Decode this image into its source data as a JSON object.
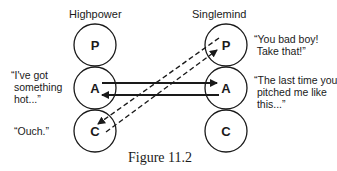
{
  "diagram": {
    "columns": [
      {
        "name": "Highpower",
        "states": [
          "P",
          "A",
          "C"
        ]
      },
      {
        "name": "Singlemind",
        "states": [
          "P",
          "A",
          "C"
        ]
      }
    ],
    "left_quotes": [
      {
        "text": "“I've got\n something\n hot...”",
        "state": "A"
      },
      {
        "text": "“Ouch.”",
        "state": "C"
      }
    ],
    "right_quotes": [
      {
        "text": "“You bad boy!\n Take that!”",
        "state": "P"
      },
      {
        "text": "“The last time you\n pitched me like\n this...”",
        "state": "A"
      }
    ],
    "transactions": [
      {
        "from": "Highpower.A",
        "to": "Singlemind.A",
        "style": "solid"
      },
      {
        "from": "Singlemind.A",
        "to": "Highpower.A",
        "style": "solid"
      },
      {
        "from": "Highpower.C",
        "to": "Singlemind.P",
        "style": "dashed"
      },
      {
        "from": "Singlemind.P",
        "to": "Highpower.C",
        "style": "dashed"
      }
    ],
    "caption": "Figure 11.2"
  }
}
